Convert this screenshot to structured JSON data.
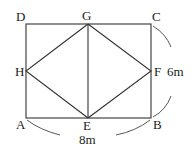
{
  "figure": {
    "type": "geometry-diagram",
    "points": {
      "A": {
        "label": "A",
        "x": 26,
        "y": 118
      },
      "B": {
        "label": "B",
        "x": 151,
        "y": 118
      },
      "C": {
        "label": "C",
        "x": 151,
        "y": 24
      },
      "D": {
        "label": "D",
        "x": 26,
        "y": 24
      },
      "E": {
        "label": "E",
        "x": 88,
        "y": 118
      },
      "F": {
        "label": "F",
        "x": 151,
        "y": 71
      },
      "G": {
        "label": "G",
        "x": 88,
        "y": 24
      },
      "H": {
        "label": "H",
        "x": 26,
        "y": 71
      }
    },
    "segments": [
      "AB",
      "BC",
      "CD",
      "DA",
      "EF",
      "FG",
      "GH",
      "HE",
      "GE"
    ],
    "dimensions": {
      "width_label": "8m",
      "height_label": "6m"
    }
  }
}
